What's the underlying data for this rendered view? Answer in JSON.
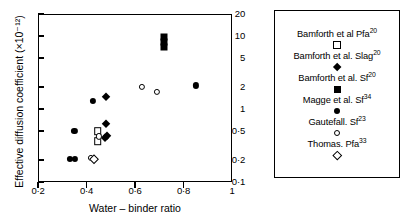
{
  "chart_data": {
    "type": "scatter",
    "title": "",
    "xlabel": "Water – binder ratio",
    "ylabel": "Effective diffusion coefficient (×10⁻¹²)",
    "xlim": [
      0.2,
      1.0
    ],
    "ylim": [
      0.1,
      20
    ],
    "yscale": "log",
    "xscale": "linear",
    "grid": false,
    "legend_position": "right-outside",
    "xticks": [
      0.2,
      0.4,
      0.6,
      0.8
    ],
    "xtick_labels": [
      "0·2",
      "0·4",
      "0·6",
      "0·8"
    ],
    "yticks": [
      0.1,
      0.2,
      0.5,
      1,
      2,
      5,
      10,
      20
    ],
    "ytick_labels": [
      "0·1",
      "0·2",
      "0·5",
      "1",
      "2",
      "5",
      "10",
      "20"
    ],
    "series": [
      {
        "name": "Bamforth et al Pfa",
        "reference": "20",
        "marker": "open-square",
        "points": [
          {
            "x": 0.447,
            "y": 0.5
          },
          {
            "x": 0.447,
            "y": 0.36
          }
        ]
      },
      {
        "name": "Bamforth et al. Slag",
        "reference": "20",
        "marker": "filled-diamond",
        "points": [
          {
            "x": 0.482,
            "y": 1.45
          },
          {
            "x": 0.482,
            "y": 0.63
          },
          {
            "x": 0.484,
            "y": 0.42
          },
          {
            "x": 0.478,
            "y": 0.4
          }
        ]
      },
      {
        "name": "Bamforth et al. Sf",
        "reference": "20",
        "marker": "filled-square",
        "points": [
          {
            "x": 0.721,
            "y": 9.8
          },
          {
            "x": 0.721,
            "y": 8.2
          },
          {
            "x": 0.721,
            "y": 7.0
          }
        ]
      },
      {
        "name": "Magge et al. Sf",
        "reference": "34",
        "marker": "filled-circle",
        "points": [
          {
            "x": 0.33,
            "y": 0.205
          },
          {
            "x": 0.352,
            "y": 0.205
          },
          {
            "x": 0.35,
            "y": 0.5
          },
          {
            "x": 0.428,
            "y": 1.3
          },
          {
            "x": 0.85,
            "y": 2.1
          }
        ]
      },
      {
        "name": "Gautefall. Sf",
        "reference": "23",
        "marker": "open-circle",
        "points": [
          {
            "x": 0.452,
            "y": 0.42
          },
          {
            "x": 0.418,
            "y": 0.215
          },
          {
            "x": 0.63,
            "y": 2.0
          },
          {
            "x": 0.69,
            "y": 1.7
          }
        ]
      },
      {
        "name": "Thomas. Pfa",
        "reference": "33",
        "marker": "open-diamond",
        "points": [
          {
            "x": 0.432,
            "y": 0.205
          }
        ]
      }
    ]
  },
  "legend": {
    "entries": [
      {
        "label": "Bamforth et al Pfa",
        "sup": "20",
        "marker": "open-square"
      },
      {
        "label": "Bamforth et al. Slag",
        "sup": "20",
        "marker": "filled-diamond"
      },
      {
        "label": "Bamforth et al. Sf",
        "sup": "20",
        "marker": "filled-square"
      },
      {
        "label": "Magge et al. Sf",
        "sup": "34",
        "marker": "filled-circle"
      },
      {
        "label": "Gautefall. Sf",
        "sup": "23",
        "marker": "open-circle"
      },
      {
        "label": "Thomas. Pfa",
        "sup": "33",
        "marker": "open-diamond"
      }
    ]
  }
}
